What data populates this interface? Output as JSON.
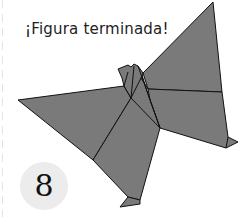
{
  "caption": {
    "title": "¡Figura terminada!"
  },
  "step": {
    "number": "8"
  },
  "figure": {
    "fill_color": "#7a7a7a",
    "stroke_color": "#111111"
  }
}
